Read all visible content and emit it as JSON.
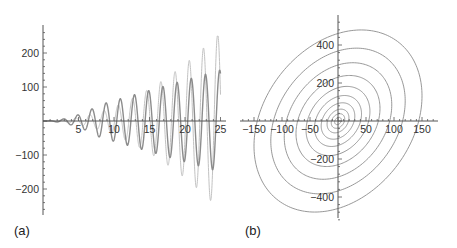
{
  "chart_data": [
    {
      "id": "a",
      "type": "line",
      "panel_label": "(a)",
      "title": "",
      "xlabel": "",
      "ylabel": "",
      "xlim": [
        0,
        25
      ],
      "ylim": [
        -260,
        260
      ],
      "x_ticks": [
        "5",
        "10",
        "15",
        "20",
        "25"
      ],
      "y_ticks": [
        "200",
        "100",
        "-100",
        "-200"
      ],
      "grid": false,
      "series": [
        {
          "name": "small-oscillation",
          "color": "#8c8c8c",
          "description": "oscillation with growing amplitude ~ 6*t",
          "amplitude_factor": 6.0,
          "period": 2.0
        },
        {
          "name": "large-oscillation",
          "color": "#c2c2c2",
          "description": "oscillation with rapidly growing amplitude, clipped at ±250 near t>17",
          "amplitude_factor": 0.5,
          "growth": "quadratic-ish",
          "period": 2.0
        }
      ]
    },
    {
      "id": "b",
      "type": "line",
      "panel_label": "(b)",
      "title": "",
      "xlabel": "",
      "ylabel": "",
      "xlim": [
        -160,
        160
      ],
      "ylim": [
        -480,
        500
      ],
      "x_ticks": [
        "-150",
        "-100",
        "-50",
        "50",
        "100",
        "150"
      ],
      "y_ticks": [
        "400",
        "200",
        "-200",
        "-400"
      ],
      "grid": false,
      "series": [
        {
          "name": "concentric-tilted-ellipses",
          "color": "#8c8c8c",
          "description": "parametric spiral/ellipses centered at origin, tilted; outermost reaching x≈±155, y≈±480",
          "ring_scales": [
            0.04,
            0.08,
            0.13,
            0.2,
            0.28,
            0.38,
            0.5,
            0.64,
            0.8,
            1.0
          ]
        }
      ]
    }
  ]
}
